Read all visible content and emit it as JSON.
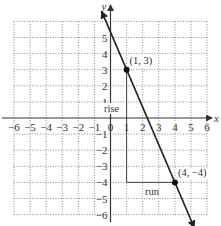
{
  "chart_data": {
    "type": "line",
    "title": "",
    "xlabel": "x",
    "ylabel": "y",
    "xlim": [
      -6,
      6
    ],
    "ylim": [
      -6,
      6
    ],
    "grid": true,
    "grid_style": "dotted",
    "x_ticks": [
      "-6",
      "-5",
      "-4",
      "-3",
      "-2",
      "-1",
      "0",
      "1",
      "2",
      "3",
      "4",
      "5",
      "6"
    ],
    "y_ticks": [
      "6",
      "5",
      "4",
      "3",
      "2",
      "1",
      "-1",
      "-2",
      "-3",
      "-4",
      "-5",
      "-6"
    ],
    "series": [
      {
        "name": "line through (1, 3) and (4, -4)",
        "slope": -2.3333,
        "x": [
          -0.55,
          5.2
        ],
        "y": [
          6.62,
          -6.8
        ],
        "arrows": "both"
      }
    ],
    "points": [
      {
        "x": 1,
        "y": 3,
        "label": "(1, 3)"
      },
      {
        "x": 4,
        "y": -4,
        "label": "(4, −4)"
      }
    ],
    "annotations": [
      {
        "text": "rise",
        "x": 0.0,
        "y": 0.3,
        "segment": {
          "from": [
            1,
            3
          ],
          "to": [
            1,
            -4
          ]
        }
      },
      {
        "text": "run",
        "x": 2.5,
        "y": -4.6,
        "segment": {
          "from": [
            1,
            -4
          ],
          "to": [
            4,
            -4
          ]
        }
      }
    ]
  },
  "labels": {
    "x_axis": "x",
    "y_axis": "y",
    "rise": "rise",
    "run": "run",
    "point1": "(1, 3)",
    "point2": "(4, −4)",
    "x_tick_labels": [
      "−6",
      "−5",
      "−4",
      "−3",
      "−2",
      "−1",
      "0",
      "1",
      "2",
      "3",
      "4",
      "5",
      "6"
    ],
    "y_tick_labels_pos": [
      "1",
      "2",
      "3",
      "4",
      "5",
      "6"
    ],
    "y_tick_labels_neg": [
      "−1",
      "−2",
      "−3",
      "−4",
      "−5",
      "−6"
    ]
  },
  "colors": {
    "background": "#ffffff",
    "grid": "#8a8a8a",
    "axis": "#333333",
    "line": "#222222"
  }
}
